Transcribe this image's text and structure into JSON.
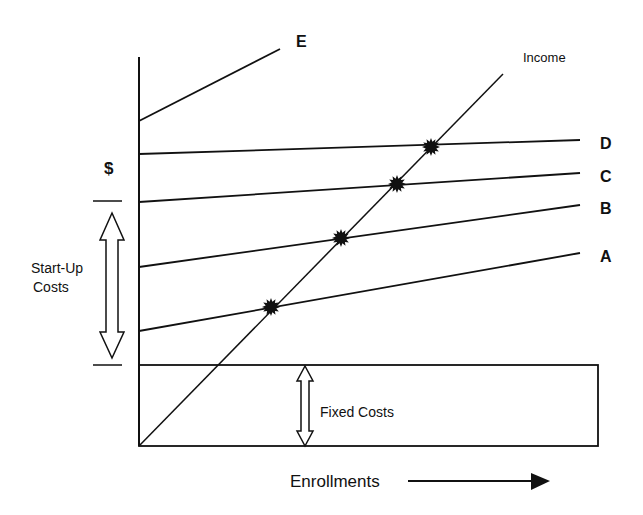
{
  "diagram": {
    "y_axis_label": "$",
    "x_axis_label": "Enrollments",
    "income_label": "Income",
    "start_up_label_line1": "Start-Up",
    "start_up_label_line2": "Costs",
    "fixed_costs_label": "Fixed Costs",
    "cost_lines": [
      {
        "label": "A",
        "x1": 139,
        "y1": 331,
        "x2": 580,
        "y2": 253
      },
      {
        "label": "B",
        "x1": 139,
        "y1": 267,
        "x2": 580,
        "y2": 205
      },
      {
        "label": "C",
        "x1": 139,
        "y1": 202,
        "x2": 580,
        "y2": 173
      },
      {
        "label": "D",
        "x1": 139,
        "y1": 154,
        "x2": 580,
        "y2": 140
      },
      {
        "label": "E",
        "x1": 139,
        "y1": 121,
        "x2": 280,
        "y2": 49
      }
    ],
    "income_line": {
      "x1": 139,
      "y1": 446,
      "x2": 503,
      "y2": 74
    },
    "break_even_points": [
      {
        "line": "A",
        "x": 271,
        "y": 307
      },
      {
        "line": "B",
        "x": 341,
        "y": 238
      },
      {
        "line": "C",
        "x": 397,
        "y": 184
      },
      {
        "line": "D",
        "x": 431,
        "y": 147
      }
    ],
    "colors": {
      "ink": "#111111",
      "background": "#ffffff"
    }
  }
}
